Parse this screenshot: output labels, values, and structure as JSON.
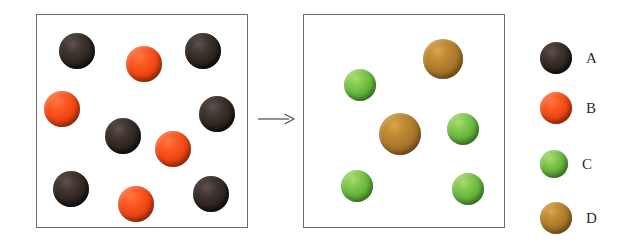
{
  "figure": {
    "type": "particle-diagram",
    "background_color": "#ffffff",
    "border_color": "#6d6d6d"
  },
  "arrow": {
    "name": "reaction-arrow",
    "direction": "right",
    "color": "#4a4a4a"
  },
  "panels": [
    {
      "id": "before",
      "name": "before-reaction-box",
      "x": 36,
      "y": 14,
      "width": 212,
      "height": 214,
      "spheres": [
        {
          "species": "A",
          "x": 77,
          "y": 51,
          "r": 18
        },
        {
          "species": "B",
          "x": 144,
          "y": 64,
          "r": 18
        },
        {
          "species": "A",
          "x": 203,
          "y": 51,
          "r": 18
        },
        {
          "species": "B",
          "x": 62,
          "y": 109,
          "r": 18
        },
        {
          "species": "A",
          "x": 217,
          "y": 114,
          "r": 18
        },
        {
          "species": "A",
          "x": 123,
          "y": 136,
          "r": 18
        },
        {
          "species": "B",
          "x": 173,
          "y": 149,
          "r": 18
        },
        {
          "species": "A",
          "x": 71,
          "y": 189,
          "r": 18
        },
        {
          "species": "B",
          "x": 136,
          "y": 204,
          "r": 18
        },
        {
          "species": "A",
          "x": 211,
          "y": 194,
          "r": 18
        }
      ],
      "counts": {
        "A": 6,
        "B": 4,
        "C": 0,
        "D": 0,
        "total": 10
      }
    },
    {
      "id": "after",
      "name": "after-reaction-box",
      "x": 303,
      "y": 14,
      "width": 202,
      "height": 214,
      "spheres": [
        {
          "species": "D",
          "x": 443,
          "y": 59,
          "r": 20
        },
        {
          "species": "C",
          "x": 360,
          "y": 85,
          "r": 16
        },
        {
          "species": "D",
          "x": 400,
          "y": 134,
          "r": 21
        },
        {
          "species": "C",
          "x": 463,
          "y": 129,
          "r": 16
        },
        {
          "species": "C",
          "x": 357,
          "y": 186,
          "r": 16
        },
        {
          "species": "C",
          "x": 468,
          "y": 189,
          "r": 16
        }
      ],
      "counts": {
        "A": 0,
        "B": 0,
        "C": 4,
        "D": 2,
        "total": 6
      }
    }
  ],
  "legend": {
    "name": "species-legend",
    "items": [
      {
        "label": "A",
        "color": "#2c241f",
        "color_name": "black",
        "y": 44,
        "r": 16
      },
      {
        "label": "B",
        "color": "#ef4513",
        "color_name": "orange-red",
        "y": 94,
        "r": 16
      },
      {
        "label": "C",
        "color": "#63b13b",
        "color_name": "green",
        "y": 150,
        "r": 14
      },
      {
        "label": "D",
        "color": "#a9762a",
        "color_name": "brown-gold",
        "y": 204,
        "r": 16
      }
    ]
  }
}
